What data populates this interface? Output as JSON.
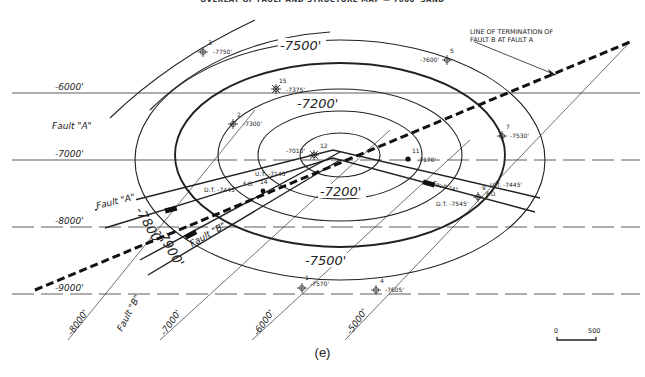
{
  "title": "OVERLAY OF FAULT AND STRUCTURE MAP — 7600' SAND",
  "caption": "(e)",
  "annotation": {
    "line1": "LINE OF TERMINATION OF",
    "line2": "FAULT B AT FAULT A"
  },
  "fault_plane_contours_horizontal": [
    {
      "label": "-6000'",
      "y": 93,
      "style": "solid"
    },
    {
      "label": "-7000'",
      "y": 160,
      "style": "solid"
    },
    {
      "label": "-8000'",
      "y": 227,
      "style": "dashed"
    },
    {
      "label": "-9000'",
      "y": 294,
      "style": "dashed"
    }
  ],
  "fault_plane_contours_diagonal": [
    {
      "label": "-8000'"
    },
    {
      "label": "-7000'"
    },
    {
      "label": "-6000'"
    },
    {
      "label": "-5000'"
    }
  ],
  "fault_labels": {
    "a_left": "Fault \"A\"",
    "a_on_trace": "Fault \"A\"",
    "a_right": "Fault \"A\"",
    "b_on_trace": "Fault \"B\"",
    "b_bottom": "Fault \"B\""
  },
  "structure_contours": {
    "c7200_top": "-7200'",
    "c7200_center": "-7200'",
    "c7500_top": "-7500'",
    "c7500_bottom": "-7500'",
    "c7800": "-7800'",
    "c7900": "-7900'"
  },
  "wells": [
    {
      "id": "3",
      "depth": "-7750'"
    },
    {
      "id": "5",
      "depth": "-7600'"
    },
    {
      "id": "15",
      "depth": "-7375'"
    },
    {
      "id": "2",
      "depth": "-7300'"
    },
    {
      "id": "7",
      "depth": "-7530'"
    },
    {
      "id": "12",
      "depth": "-7010'"
    },
    {
      "id": "11",
      "depth": "-7170'"
    },
    {
      "id": "14",
      "depth": ""
    },
    {
      "id": "9",
      "depth": ""
    },
    {
      "id": "1",
      "depth": "-7570'"
    },
    {
      "id": "4",
      "depth": "-7605'"
    }
  ],
  "fault_cuts": {
    "well14_ut": "U.T. -7145'",
    "well14_dt": "D.T. -7445'",
    "well14_fo": "F.O.",
    "well9_ut": "U.T. -7445'",
    "well9_dt": "D.T. -7545'",
    "well9_fo": "F.O."
  },
  "scale_bar": {
    "start": "0",
    "end": "500"
  }
}
